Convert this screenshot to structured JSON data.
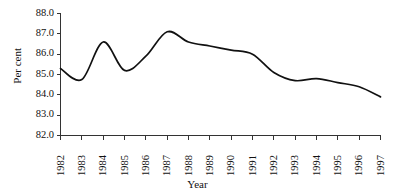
{
  "chart_data": {
    "type": "line",
    "title": "",
    "xlabel": "Year",
    "ylabel": "Per cent",
    "x": [
      1982,
      1983,
      1984,
      1985,
      1986,
      1987,
      1988,
      1989,
      1990,
      1991,
      1992,
      1993,
      1994,
      1995,
      1996,
      1997
    ],
    "values": [
      85.3,
      84.75,
      86.6,
      85.2,
      85.9,
      87.1,
      86.6,
      86.4,
      86.2,
      86.0,
      85.1,
      84.7,
      84.8,
      84.6,
      84.4,
      83.9
    ],
    "series": [
      {
        "name": "Per cent",
        "values": [
          85.3,
          84.75,
          86.6,
          85.2,
          85.9,
          87.1,
          86.6,
          86.4,
          86.2,
          86.0,
          85.1,
          84.7,
          84.8,
          84.6,
          84.4,
          83.9
        ]
      }
    ],
    "xlim": [
      1982,
      1997
    ],
    "ylim": [
      82.0,
      88.0
    ],
    "ytick_labels": [
      "88.0",
      "87.0",
      "86.0",
      "85.0",
      "84.0",
      "83.0",
      "82.0"
    ],
    "ytick_values": [
      88.0,
      87.0,
      86.0,
      85.0,
      84.0,
      83.0,
      82.0
    ],
    "xtick_labels": [
      "1982",
      "1983",
      "1984",
      "1985",
      "1986",
      "1987",
      "1988",
      "1989",
      "1990",
      "1991",
      "1992",
      "1993",
      "1994",
      "1995",
      "1996",
      "1997"
    ],
    "grid": false,
    "legend": false,
    "legend_position": "none",
    "line_color": "#111111",
    "background_color": "#ffffff",
    "annotations": []
  },
  "axes": {
    "y_axis_title": "Per cent",
    "x_axis_title": "Year"
  }
}
